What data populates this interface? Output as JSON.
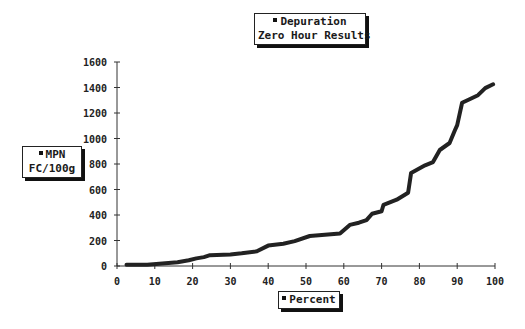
{
  "chart_data": {
    "type": "line",
    "title": "Depuration",
    "subtitle": "Zero Hour Results",
    "xlabel": "Percent",
    "ylabel": "MPN FC/100g",
    "legend": [
      {
        "name": "Depuration",
        "marker": "square"
      }
    ],
    "xlim": [
      0,
      100
    ],
    "ylim": [
      0,
      1600
    ],
    "x_ticks": [
      0,
      10,
      20,
      30,
      40,
      50,
      60,
      70,
      80,
      90,
      100
    ],
    "y_ticks": [
      0,
      200,
      400,
      600,
      800,
      1000,
      1200,
      1400,
      1600
    ],
    "grid": false,
    "series": [
      {
        "name": "Depuration",
        "x": [
          2.5,
          8,
          12,
          16,
          19,
          21,
          23,
          24.6,
          30,
          33,
          37,
          40,
          44,
          47,
          51,
          55,
          59,
          61.6,
          64,
          66,
          67.5,
          70,
          70.5,
          74,
          77,
          77.8,
          81.5,
          83.6,
          85.4,
          88,
          89.4,
          90,
          91.3,
          93.4,
          95.5,
          97.4,
          99.5
        ],
        "y": [
          10,
          10,
          20,
          30,
          45,
          60,
          70,
          85,
          90,
          100,
          115,
          160,
          175,
          195,
          235,
          245,
          255,
          322,
          340,
          360,
          410,
          430,
          480,
          520,
          575,
          730,
          790,
          815,
          910,
          965,
          1065,
          1105,
          1280,
          1310,
          1340,
          1395,
          1425
        ]
      }
    ]
  },
  "title_box": {
    "line1": "Depuration",
    "line2": "Zero Hour Results"
  },
  "y_label_box": {
    "line1": "MPN",
    "line2": "FC/100g"
  },
  "x_label_box": {
    "line1": "Percent"
  }
}
